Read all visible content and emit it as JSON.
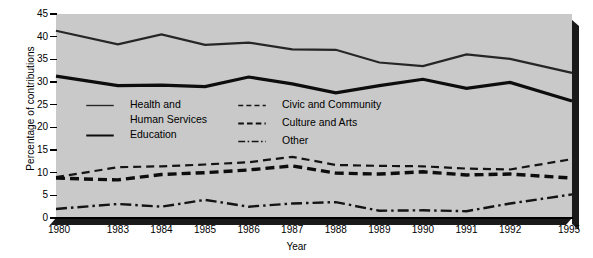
{
  "chart_data": {
    "type": "line",
    "title": "",
    "xlabel": "Year",
    "ylabel": "Percentage of contributions",
    "categories": [
      "1980",
      "1983",
      "1984",
      "1985",
      "1986",
      "1987",
      "1988",
      "1989",
      "1990",
      "1991",
      "1992",
      "1995"
    ],
    "xtick_labels": [
      "1980",
      "1983",
      "1984",
      "1985",
      "1986",
      "1987",
      "1988",
      "1989",
      "1990",
      "1991",
      "1992",
      "1995"
    ],
    "ytick_labels": [
      "0",
      "5",
      "10",
      "15",
      "20",
      "25",
      "30",
      "35",
      "40",
      "45"
    ],
    "ylim": [
      0,
      45
    ],
    "ytick_step": 5,
    "grid": false,
    "legend_position": "inside-upper-left",
    "plot_background": "#c9c9c9",
    "series": [
      {
        "name": "Health and Human Services",
        "legend_label_line1": "Health and",
        "legend_label_line2": "Human Services",
        "style": "solid",
        "line_width": 2.2,
        "color": "#262626",
        "values": [
          41.3,
          38.3,
          40.5,
          38.2,
          38.7,
          37.2,
          37.1,
          34.3,
          33.5,
          36.1,
          35.1,
          32.0
        ]
      },
      {
        "name": "Education",
        "legend_label_line1": "Education",
        "legend_label_line2": "",
        "style": "solid",
        "line_width": 3.2,
        "color": "#0d0d0d",
        "values": [
          31.3,
          29.2,
          29.3,
          29.0,
          31.1,
          29.6,
          27.6,
          29.2,
          30.6,
          28.6,
          29.9,
          25.8
        ]
      },
      {
        "name": "Civic and Community",
        "legend_label_line1": "Civic and Community",
        "legend_label_line2": "",
        "style": "dashed",
        "line_width": 2.2,
        "color": "#141414",
        "values": [
          9.0,
          11.2,
          11.4,
          11.8,
          12.3,
          13.5,
          11.7,
          11.5,
          11.4,
          10.9,
          10.7,
          13.0
        ]
      },
      {
        "name": "Culture and Arts",
        "legend_label_line1": "Culture and Arts",
        "legend_label_line2": "",
        "style": "dashed",
        "line_width": 3.4,
        "color": "#0d0d0d",
        "values": [
          8.8,
          8.4,
          9.6,
          10.0,
          10.6,
          11.5,
          9.9,
          9.7,
          10.2,
          9.5,
          9.7,
          8.8
        ]
      },
      {
        "name": "Other",
        "legend_label_line1": "Other",
        "legend_label_line2": "",
        "style": "dashdot",
        "line_width": 2.4,
        "color": "#141414",
        "values": [
          2.0,
          3.1,
          2.5,
          4.0,
          2.5,
          3.2,
          3.5,
          1.6,
          1.7,
          1.5,
          3.2,
          5.2
        ]
      }
    ]
  }
}
